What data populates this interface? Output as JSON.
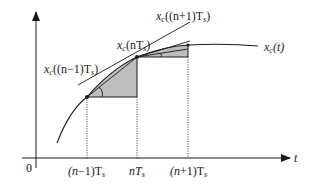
{
  "figure": {
    "colors": {
      "curve": "#1a1a1a",
      "axis": "#1a1a1a",
      "shade": "#bdbdbd",
      "dotted": "#555555",
      "background": "#ffffff"
    }
  },
  "axes": {
    "origin_label": "0",
    "x_axis_label": "t"
  },
  "labels": {
    "curve": {
      "base": "x",
      "sub": "c",
      "arg": "(t)"
    },
    "point_prev": {
      "base": "x",
      "sub": "c",
      "arg_pre": "((n",
      "op": "−",
      "arg_mid": "1)T",
      "arg_sub": "s",
      "arg_post": ")"
    },
    "point_cur": {
      "base": "x",
      "sub": "c",
      "arg_pre": "(nT",
      "arg_sub": "s",
      "arg_post": ")"
    },
    "point_next": {
      "base": "x",
      "sub": "c",
      "arg_pre": "((n",
      "op": "+",
      "arg_mid": "1)T",
      "arg_sub": "s",
      "arg_post": ")"
    }
  },
  "ticks": [
    {
      "id": "prev",
      "pre": "(n",
      "op": "−",
      "mid": "1)T",
      "sub": "s"
    },
    {
      "id": "cur",
      "pre": "nT",
      "sub": "s"
    },
    {
      "id": "next",
      "pre": "(n",
      "op": "+",
      "mid": "1)T",
      "sub": "s"
    }
  ],
  "sample_points": [
    {
      "name": "(n-1)Ts",
      "x": 87,
      "y": 97
    },
    {
      "name": "nTs",
      "x": 137,
      "y": 57
    },
    {
      "name": "(n+1)Ts",
      "x": 188,
      "y": 45
    }
  ]
}
